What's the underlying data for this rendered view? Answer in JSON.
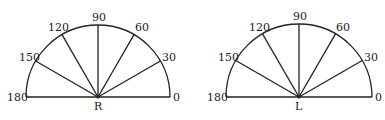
{
  "diagrams": [
    {
      "center_label": "R",
      "angles": [
        "0",
        "30",
        "60",
        "90",
        "120",
        "150",
        "180"
      ]
    },
    {
      "center_label": "L",
      "angles": [
        "0",
        "30",
        "60",
        "90",
        "120",
        "150",
        "180"
      ]
    }
  ],
  "colors": {
    "stroke": "#222222",
    "background": "#ffffff"
  }
}
